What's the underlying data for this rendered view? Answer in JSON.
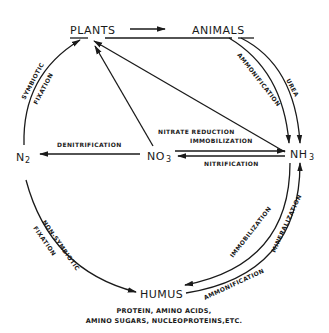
{
  "diagram": {
    "nodes": {
      "plants": "PLANTS",
      "animals": "ANIMALS",
      "n2_base": "N",
      "n2_sub": "2",
      "no3_base": "NO",
      "no3_sub": "3",
      "nh3_base": "NH",
      "nh3_sub": "3",
      "humus": "HUMUS"
    },
    "edges": {
      "symbiotic": "SYMBIOTIC",
      "fixation_top": "FIXATION",
      "ammonification_top": "AMMONIFICATION",
      "urea": "UREA",
      "denitrification": "DENITRIFICATION",
      "nitrate_reduction": "NITRATE REDUCTION",
      "immobilization_mid": "IMMOBILIZATION",
      "nitrification": "NITRIFICATION",
      "non_symbiotic": "NON-SYMBIOTIC",
      "fixation_bottom": "FIXATION",
      "immobilization_bottom": "IMMOBILIZATION",
      "mineralization": "MINERALIZATION",
      "ammonification_bottom": "AMMONIFICATION"
    },
    "caption": {
      "line1": "PROTEIN, AMINO ACIDS,",
      "line2": "AMINO SUGARS, NUCLEOPROTEINS,ETC."
    }
  }
}
